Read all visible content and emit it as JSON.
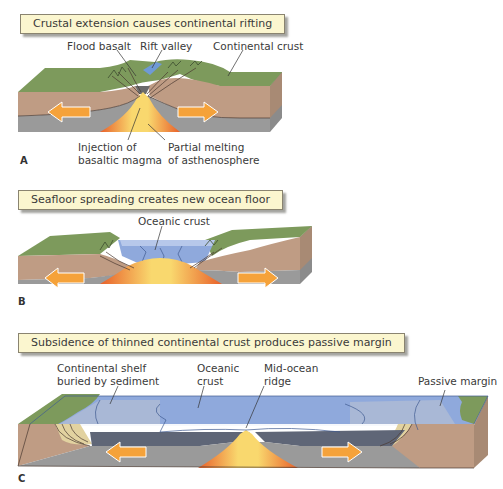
{
  "panels": [
    {
      "letter": "A",
      "title": "Crustal extension causes continental rifting",
      "labels": {
        "flood_basalt": "Flood basalt",
        "rift_valley": "Rift valley",
        "continental_crust": "Continental crust",
        "injection_line1": "Injection of",
        "injection_line2": "basaltic magma",
        "melting_line1": "Partial melting",
        "melting_line2": "of asthenosphere"
      }
    },
    {
      "letter": "B",
      "title": "Seafloor spreading creates new ocean floor",
      "labels": {
        "oceanic_crust": "Oceanic crust"
      }
    },
    {
      "letter": "C",
      "title": "Subsidence of thinned continental crust produces passive margin",
      "labels": {
        "shelf_line1": "Continental shelf",
        "shelf_line2": "buried by sediment",
        "oceanic_line1": "Oceanic",
        "oceanic_line2": "crust",
        "ridge_line1": "Mid-ocean",
        "ridge_line2": "ridge",
        "passive_margin": "Passive margin"
      }
    }
  ],
  "colors": {
    "title_bg": "#fbf6cf",
    "land_green": "#7d9a5c",
    "crust_tan": "#bf9c84",
    "mantle_gray": "#9a9a9a",
    "magma_orange": "#f07a2a",
    "magma_yellow": "#f7d36a",
    "ocean_blue": "#8fa9dc",
    "arrow_orange": "#f5a23a"
  }
}
